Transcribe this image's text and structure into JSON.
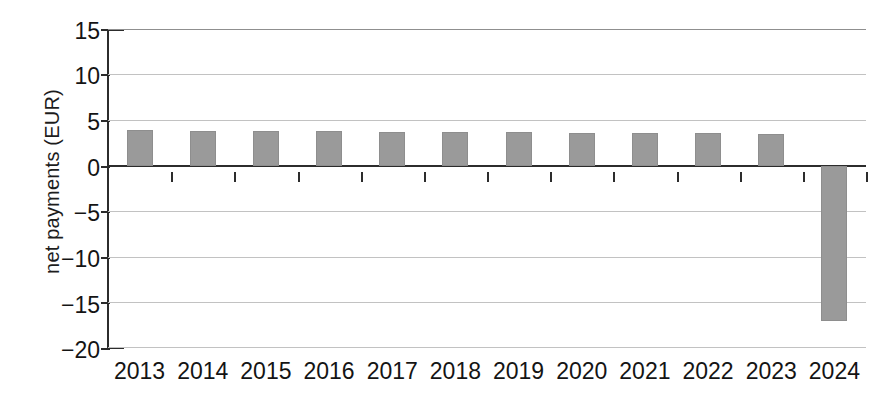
{
  "chart_data": {
    "type": "bar",
    "title": "",
    "xlabel": "",
    "ylabel": "net payments (EUR)",
    "categories": [
      "2013",
      "2014",
      "2015",
      "2016",
      "2017",
      "2018",
      "2019",
      "2020",
      "2021",
      "2022",
      "2023",
      "2024"
    ],
    "values": [
      3.9,
      3.85,
      3.8,
      3.8,
      3.75,
      3.7,
      3.65,
      3.6,
      3.6,
      3.55,
      3.5,
      -17.0
    ],
    "ylim": [
      -20,
      15
    ],
    "yticks": [
      15,
      10,
      5,
      0,
      -5,
      -10,
      -15,
      -20
    ],
    "ytick_labels": [
      "15",
      "10",
      "5",
      "0",
      "−5",
      "−10",
      "−15",
      "−20"
    ],
    "grid": true,
    "legend": "none",
    "bar_color": "#9a9a9a",
    "axis_color": "#2c2c2c",
    "gridline_color": "#c2c2c2"
  }
}
